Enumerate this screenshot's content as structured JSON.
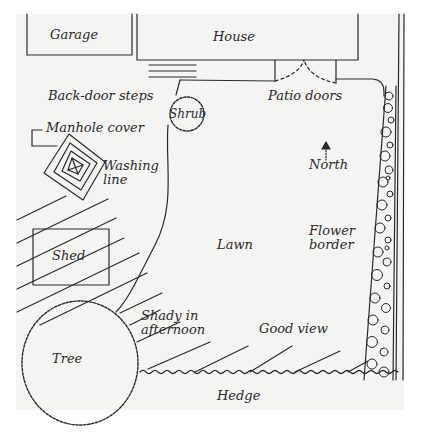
{
  "diagram": {
    "type": "garden-plan",
    "ink_color": "#2a2a2a",
    "paper_color": "#f4f4f2",
    "labels": {
      "garage": "Garage",
      "house": "House",
      "back_door_steps": "Back-door steps",
      "patio_doors": "Patio doors",
      "shrub": "Shrub",
      "manhole_cover": "Manhole cover",
      "washing_line": "Washing\nline",
      "north": "North",
      "shed": "Shed",
      "lawn": "Lawn",
      "flower_border": "Flower\nborder",
      "shady": "Shady in\nafternoon",
      "good_view": "Good view",
      "tree": "Tree",
      "hedge": "Hedge"
    },
    "features": [
      {
        "name": "Garage",
        "shape": "rectangle"
      },
      {
        "name": "House",
        "shape": "rectangle"
      },
      {
        "name": "Back-door steps",
        "shape": "parallel-lines"
      },
      {
        "name": "Patio doors",
        "shape": "double-door-arc"
      },
      {
        "name": "Shrub",
        "shape": "scalloped-circle"
      },
      {
        "name": "Manhole cover",
        "shape": "bracket-pointer"
      },
      {
        "name": "Washing line",
        "shape": "nested-diamond"
      },
      {
        "name": "North",
        "shape": "arrow-up"
      },
      {
        "name": "Shed",
        "shape": "rectangle"
      },
      {
        "name": "Lawn",
        "shape": "open-area"
      },
      {
        "name": "Flower border",
        "shape": "flower-strip"
      },
      {
        "name": "Shady in afternoon",
        "shape": "diagonal-hatching"
      },
      {
        "name": "Good view",
        "shape": "text"
      },
      {
        "name": "Tree",
        "shape": "scalloped-circle"
      },
      {
        "name": "Hedge",
        "shape": "wavy-line"
      }
    ]
  }
}
